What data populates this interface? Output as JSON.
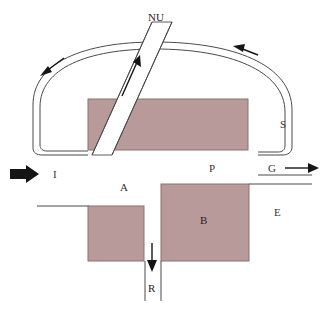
{
  "figure": {
    "background_color": "#ffffff",
    "fill_color": "#b99a9a",
    "line_color": "#4a4a4a",
    "arrow_color": "#151515"
  },
  "labels": {
    "nu": "NU",
    "s": "S",
    "i": "I",
    "p": "P",
    "g": "G",
    "a": "A",
    "b": "B",
    "e": "E",
    "r": "R"
  },
  "elements": {
    "upper_loop": "double-line arc loop",
    "diagonal_band": "NU inclined channel",
    "upper_block": "large filled rectangle under arc",
    "block_a": "A",
    "block_b": "B",
    "inlet_arrow": "I",
    "outlet_arrow": "G",
    "recycle_arrow": "R",
    "band_flow_arrow": "upward flow in NU band",
    "loop_flow_arrow_left": "leftward flow on loop",
    "loop_flow_arrow_right": "leftward flow on loop right"
  }
}
